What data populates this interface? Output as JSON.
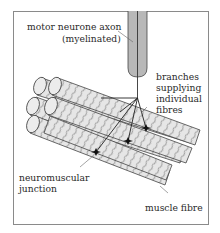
{
  "diagram": {
    "title": "",
    "labels": {
      "axon_line1": "motor neurone axon",
      "axon_line2": "(myelinated)",
      "branches_line1": "branches",
      "branches_line2": "supplying",
      "branches_line3": "individual",
      "branches_line4": "fibres",
      "junction_line1": "neuromuscular",
      "junction_line2": "junction",
      "muscle_fibre": "muscle fibre"
    },
    "colors": {
      "axon_fill": "#b8b8b8",
      "fibre_fill": "#e6e6e6",
      "outline": "#444444",
      "frame": "#8a8a8a",
      "text": "#2a2a2a"
    },
    "elements": {
      "fibre_count": 6,
      "junction_count": 4
    }
  }
}
